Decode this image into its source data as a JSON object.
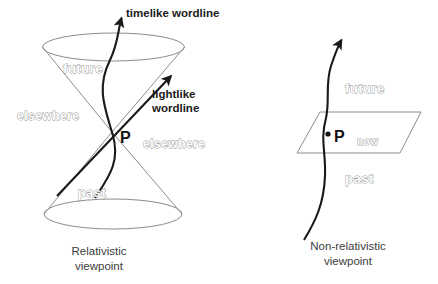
{
  "figure": {
    "background_color": "#ffffff",
    "line_color_structure": "#8c8c8c",
    "line_color_worldline": "#1a1a1a",
    "label_outline_color": "#8c8c8c",
    "label_solid_color": "#1a1a1a",
    "caption_color": "#3d3d3d"
  },
  "left_panel": {
    "caption_line1": "Relativistic",
    "caption_line2": "viewpoint",
    "event_point": "P",
    "regions": {
      "future": "future",
      "past": "past",
      "elsewhere_left": "elsewhere",
      "elsewhere_right": "elsewhere"
    },
    "annotations": {
      "timelike": "timelike wordline",
      "lightlike_line1": "lightlike",
      "lightlike_line2": "wordline"
    }
  },
  "right_panel": {
    "caption_line1": "Non-relativistic",
    "caption_line2": "viewpoint",
    "event_point": "P",
    "regions": {
      "future": "future",
      "past": "past",
      "now": "now"
    }
  }
}
